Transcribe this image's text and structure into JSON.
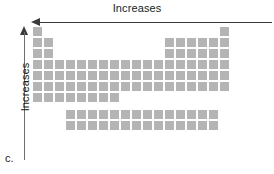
{
  "figure": {
    "panel_label": "c.",
    "accent_color": "#b4b4b4",
    "axis_color": "#3a3a3a",
    "background_color": "#ffffff"
  },
  "horizontal_axis": {
    "label": "Increases",
    "direction": "left",
    "arrowhead": "arrow-left-icon"
  },
  "vertical_axis": {
    "label": "Increases",
    "direction": "up",
    "arrowhead": "arrow-up-icon"
  },
  "chart_data": {
    "type": "diagram",
    "subtype": "periodic-table-schematic",
    "title": "Increases",
    "cell_size": 9,
    "cell_pitch": 11,
    "columns": 18,
    "main_rows": 7,
    "fblock_rows": 2,
    "fblock_columns": 14,
    "fblock_start_column": 4,
    "row_occupancy": [
      {
        "period": 1,
        "groups": [
          1,
          18
        ]
      },
      {
        "period": 2,
        "groups": [
          1,
          2,
          13,
          14,
          15,
          16,
          17,
          18
        ]
      },
      {
        "period": 3,
        "groups": [
          1,
          2,
          13,
          14,
          15,
          16,
          17,
          18
        ]
      },
      {
        "period": 4,
        "groups": [
          1,
          2,
          3,
          4,
          5,
          6,
          7,
          8,
          9,
          10,
          11,
          12,
          13,
          14,
          15,
          16,
          17,
          18
        ]
      },
      {
        "period": 5,
        "groups": [
          1,
          2,
          3,
          4,
          5,
          6,
          7,
          8,
          9,
          10,
          11,
          12,
          13,
          14,
          15,
          16,
          17,
          18
        ]
      },
      {
        "period": 6,
        "groups": [
          1,
          2,
          3,
          4,
          5,
          6,
          7,
          8,
          9,
          10,
          11,
          12,
          13,
          14,
          15,
          16,
          17,
          18
        ]
      },
      {
        "period": 7,
        "groups": [
          1,
          2,
          3,
          4,
          5,
          6,
          7,
          8
        ]
      }
    ],
    "fblock_occupancy": [
      {
        "series": "lanthanides",
        "count": 14
      },
      {
        "series": "actinides",
        "count": 14
      }
    ],
    "xlabel": "Increases",
    "ylabel": "Increases",
    "legend": []
  }
}
